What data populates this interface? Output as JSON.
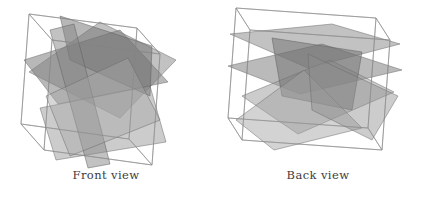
{
  "figure": {
    "width": 424,
    "height": 201,
    "background": "#ffffff",
    "panels": [
      {
        "id": "front",
        "caption": "Front view",
        "cube": {
          "stroke": "#8d8d8d",
          "stroke_width": 0.7,
          "vertices_2d": {
            "front_bottom_left": [
              44,
              150
            ],
            "front_bottom_right": [
              152,
              165
            ],
            "front_top_right": [
              160,
              54
            ],
            "front_top_left": [
              52,
              40
            ],
            "back_bottom_left": [
              21,
              124
            ],
            "back_bottom_right": [
              129,
              139
            ],
            "back_top_right": [
              137,
              28
            ],
            "back_top_left": [
              29,
              14
            ]
          }
        },
        "planes": [
          {
            "name": "plane-a",
            "fill": "#8f8f8f",
            "opacity": 0.55,
            "points": "29,72 100,22 176,60 120,118"
          },
          {
            "name": "plane-b",
            "fill": "#7d7d7d",
            "opacity": 0.55,
            "points": "24,60 120,30 168,82 58,104"
          },
          {
            "name": "plane-c",
            "fill": "#9a9a9a",
            "opacity": 0.5,
            "points": "40,108 150,86 166,142 56,160"
          },
          {
            "name": "plane-d",
            "fill": "#707070",
            "opacity": 0.5,
            "points": "60,16 152,46 150,96 70,60"
          },
          {
            "name": "plane-e",
            "fill": "#858585",
            "opacity": 0.5,
            "points": "50,30 74,24 110,164 88,168"
          },
          {
            "name": "plane-f",
            "fill": "#a6a6a6",
            "opacity": 0.45,
            "points": "46,96 128,58 160,120 70,156"
          }
        ]
      },
      {
        "id": "back",
        "caption": "Back view",
        "cube": {
          "stroke": "#8d8d8d",
          "stroke_width": 0.7,
          "stroke_color_note": "thin light gray wireframe",
          "vertices_2d": {
            "front_bottom_left": [
              30,
              140
            ],
            "front_bottom_right": [
              170,
              150
            ],
            "front_top_right": [
              178,
              40
            ],
            "front_top_left": [
              38,
              30
            ],
            "back_bottom_left": [
              16,
              118
            ],
            "back_bottom_right": [
              156,
              128
            ],
            "back_top_right": [
              164,
              18
            ],
            "back_top_left": [
              24,
              8
            ]
          }
        },
        "planes": [
          {
            "name": "plane-a",
            "fill": "#8a8a8a",
            "opacity": 0.52,
            "points": "18,34 120,24 188,44 96,68"
          },
          {
            "name": "plane-b",
            "fill": "#7b7b7b",
            "opacity": 0.52,
            "points": "16,66 110,44 190,70 88,94"
          },
          {
            "name": "plane-c",
            "fill": "#999999",
            "opacity": 0.5,
            "points": "30,96 118,60 182,92 86,134"
          },
          {
            "name": "plane-d",
            "fill": "#6f6f6f",
            "opacity": 0.5,
            "points": "60,38 150,52 140,110 70,96"
          },
          {
            "name": "plane-e",
            "fill": "#a3a3a3",
            "opacity": 0.48,
            "points": "24,120 92,70 150,128 62,150"
          },
          {
            "name": "plane-f",
            "fill": "#8f8f8f",
            "opacity": 0.45,
            "points": "96,54 186,96 160,140 100,110"
          }
        ]
      }
    ]
  }
}
